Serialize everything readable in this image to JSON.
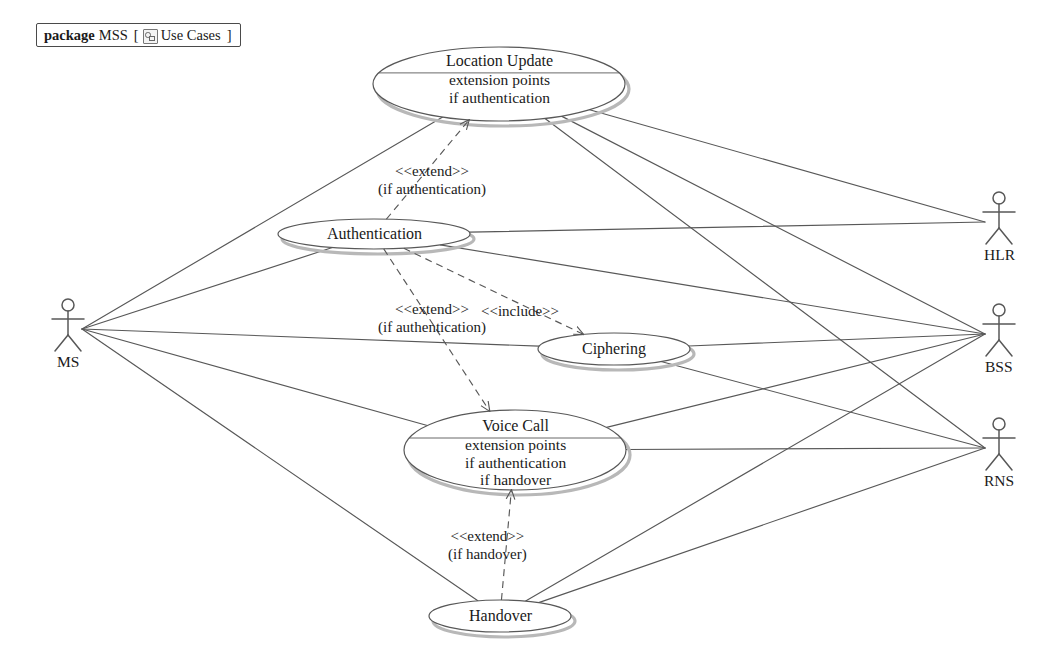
{
  "package": {
    "keyword": "package",
    "name": "MSS",
    "bracket_open": "[",
    "icon": "diagram-icon",
    "diagram_name": "Use Cases",
    "bracket_close": "]"
  },
  "colors": {
    "line": "#585858",
    "shadow": "#b8b8b8",
    "text": "#1a1a1a",
    "background": "#ffffff"
  },
  "actors": [
    {
      "id": "ms",
      "label": "MS",
      "x": 68,
      "y": 305
    },
    {
      "id": "hlr",
      "label": "HLR",
      "x": 999,
      "y": 198
    },
    {
      "id": "bss",
      "label": "BSS",
      "x": 999,
      "y": 310
    },
    {
      "id": "rns",
      "label": "RNS",
      "x": 999,
      "y": 424
    }
  ],
  "use_cases": [
    {
      "id": "location-update",
      "title": "Location Update",
      "extension_header": "extension points",
      "extension_points": [
        "if authentication"
      ],
      "cx": 499,
      "cy": 84,
      "rx": 126,
      "ry": 37,
      "compartment": true
    },
    {
      "id": "authentication",
      "title": "Authentication",
      "extension_header": "",
      "extension_points": [],
      "cx": 374,
      "cy": 234,
      "rx": 96,
      "ry": 15,
      "compartment": false
    },
    {
      "id": "ciphering",
      "title": "Ciphering",
      "extension_header": "",
      "extension_points": [],
      "cx": 614,
      "cy": 349,
      "rx": 76,
      "ry": 16,
      "compartment": false
    },
    {
      "id": "voice-call",
      "title": "Voice Call",
      "extension_header": "extension points",
      "extension_points": [
        "if authentication",
        "if handover"
      ],
      "cx": 515,
      "cy": 450,
      "rx": 111,
      "ry": 40,
      "compartment": true
    },
    {
      "id": "handover",
      "title": "Handover",
      "extension_header": "",
      "extension_points": [],
      "cx": 500,
      "cy": 616,
      "rx": 71,
      "ry": 16,
      "compartment": false
    }
  ],
  "relations": [
    {
      "id": "extend-auth-to-location-update",
      "type": "extend",
      "stereotype": "<<extend>>",
      "condition": "(if authentication)",
      "label_x": 432,
      "label_y": 180,
      "from": "authentication",
      "to": "location-update"
    },
    {
      "id": "extend-auth-to-voice-call",
      "type": "extend",
      "stereotype": "<<extend>>",
      "condition": "(if authentication)",
      "label_x": 432,
      "label_y": 318,
      "from": "authentication",
      "to": "voice-call"
    },
    {
      "id": "include-auth-to-ciphering",
      "type": "include",
      "stereotype": "<<include>>",
      "condition": "",
      "label_x": 520,
      "label_y": 311,
      "from": "authentication",
      "to": "ciphering"
    },
    {
      "id": "extend-handover-to-voice-call",
      "type": "extend",
      "stereotype": "<<extend>>",
      "condition": "(if handover)",
      "label_x": 487,
      "label_y": 545,
      "from": "handover",
      "to": "voice-call"
    }
  ],
  "associations": [
    {
      "actor": "ms",
      "use_case": "location-update"
    },
    {
      "actor": "ms",
      "use_case": "authentication"
    },
    {
      "actor": "ms",
      "use_case": "ciphering"
    },
    {
      "actor": "ms",
      "use_case": "voice-call"
    },
    {
      "actor": "ms",
      "use_case": "handover"
    },
    {
      "actor": "hlr",
      "use_case": "location-update"
    },
    {
      "actor": "hlr",
      "use_case": "authentication"
    },
    {
      "actor": "bss",
      "use_case": "location-update"
    },
    {
      "actor": "bss",
      "use_case": "authentication"
    },
    {
      "actor": "bss",
      "use_case": "ciphering"
    },
    {
      "actor": "bss",
      "use_case": "voice-call"
    },
    {
      "actor": "bss",
      "use_case": "handover"
    },
    {
      "actor": "rns",
      "use_case": "location-update"
    },
    {
      "actor": "rns",
      "use_case": "ciphering"
    },
    {
      "actor": "rns",
      "use_case": "voice-call"
    },
    {
      "actor": "rns",
      "use_case": "handover"
    }
  ]
}
